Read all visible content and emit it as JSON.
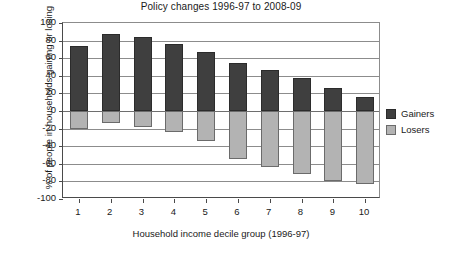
{
  "chart_data": {
    "type": "bar",
    "title": "Policy changes 1996-97 to 2008-09",
    "xlabel": "Household income decile group (1996-97)",
    "ylabel": "% of people in households gaining or losing",
    "categories": [
      "1",
      "2",
      "3",
      "4",
      "5",
      "6",
      "7",
      "8",
      "9",
      "10"
    ],
    "series": [
      {
        "name": "Gainers",
        "color": "#3f3f3f",
        "values": [
          74,
          87,
          84,
          76,
          67,
          54,
          47,
          37,
          26,
          16
        ]
      },
      {
        "name": "Losers",
        "color": "#b3b3b3",
        "values": [
          -21,
          -14,
          -18,
          -24,
          -34,
          -54,
          -64,
          -72,
          -80,
          -83
        ]
      }
    ],
    "ylim": [
      -100,
      100
    ],
    "yticks": [
      100,
      80,
      60,
      40,
      20,
      0,
      -20,
      -40,
      -60,
      -80,
      -100
    ],
    "ytick_labels": [
      "100",
      "80",
      "60",
      "40",
      "20",
      "0",
      "-20",
      "-40",
      "-60",
      "-80",
      "-100"
    ],
    "grid": true,
    "legend_position": "right",
    "legend": [
      {
        "label": "Gainers",
        "color": "#3f3f3f"
      },
      {
        "label": "Losers",
        "color": "#b3b3b3"
      }
    ]
  }
}
